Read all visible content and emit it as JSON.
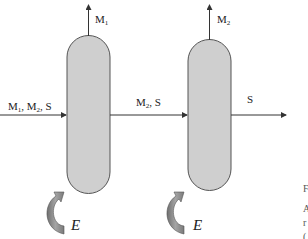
{
  "diagram": {
    "type": "process-flow",
    "inlet": {
      "label_parts": [
        "M",
        "1",
        ", M",
        "2",
        ", S"
      ]
    },
    "vessel_1": {
      "top_output": {
        "base": "M",
        "sub": "1"
      },
      "energy_label": "E"
    },
    "intermediate_stream": {
      "label_parts": [
        "M",
        "2",
        ", S"
      ]
    },
    "vessel_2": {
      "top_output": {
        "base": "M",
        "sub": "2"
      },
      "energy_label": "E"
    },
    "outlet": {
      "label": "S"
    },
    "colors": {
      "vessel_fill": "#cfcfcf",
      "vessel_stroke": "#555555",
      "arrow_fill": "#8a8a8a",
      "line": "#333333"
    }
  },
  "side_text": {
    "lines": [
      "F",
      "A",
      "r",
      "("
    ]
  }
}
